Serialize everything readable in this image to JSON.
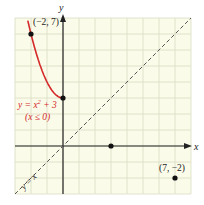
{
  "chart_data": {
    "type": "line",
    "title": "",
    "xlabel": "x",
    "ylabel": "y",
    "xlim": [
      -3,
      8
    ],
    "ylim": [
      -3,
      8
    ],
    "grid": true,
    "series": [
      {
        "name": "y = x^2 + 3 (x ≤ 0)",
        "color": "#d42a2a",
        "x": [
          -2.2,
          -2,
          -1.5,
          -1,
          -0.5,
          0
        ],
        "y": [
          7.84,
          7,
          5.25,
          4,
          3.25,
          3
        ]
      },
      {
        "name": "y = x",
        "style": "dashed",
        "color": "#555555",
        "x": [
          -3,
          8
        ],
        "y": [
          -3,
          8
        ]
      }
    ],
    "points": [
      {
        "x": -2,
        "y": 7,
        "label": "(−2, 7)"
      },
      {
        "x": 0,
        "y": 3,
        "label": ""
      },
      {
        "x": 3,
        "y": 0,
        "label": ""
      },
      {
        "x": 7,
        "y": -2,
        "label": "(7, −2)"
      }
    ],
    "annotations": {
      "curve_label_line1": "y = x",
      "curve_label_sup": "2",
      "curve_label_tail": " + 3",
      "curve_label_line2": "(x ≤ 0)",
      "diag_label": "y = x"
    }
  },
  "axes": {
    "x_label": "x",
    "y_label": "y"
  },
  "colors": {
    "grid_bg": "#fbfbe9",
    "grid_line": "#d9ddc4",
    "curve": "#d42a2a",
    "axis": "#222222"
  }
}
